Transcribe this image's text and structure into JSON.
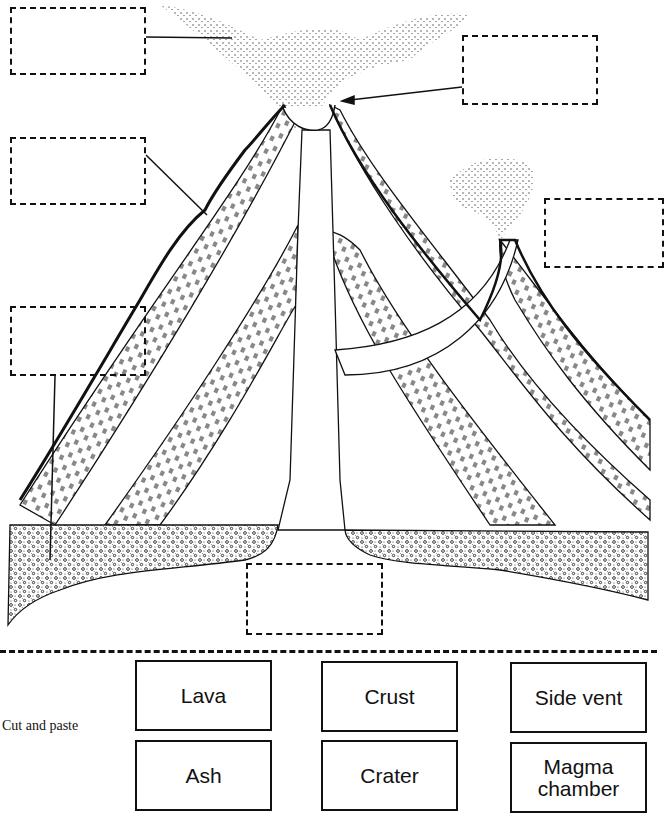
{
  "instructions": {
    "cut_label": "Cut and paste"
  },
  "answer_boxes": [
    {
      "id": "ash-cloud",
      "x": 10,
      "y": 7,
      "w": 136,
      "h": 68
    },
    {
      "id": "crater-top",
      "x": 462,
      "y": 35,
      "w": 136,
      "h": 70
    },
    {
      "id": "lava-slope",
      "x": 10,
      "y": 137,
      "w": 136,
      "h": 68
    },
    {
      "id": "side-vent",
      "x": 544,
      "y": 198,
      "w": 113,
      "h": 70
    },
    {
      "id": "crust",
      "x": 10,
      "y": 306,
      "w": 136,
      "h": 70
    },
    {
      "id": "magma-chamber",
      "x": 246,
      "y": 563,
      "w": 137,
      "h": 72
    }
  ],
  "cards": [
    {
      "label": "Lava",
      "x": 135,
      "y": 660,
      "w": 137,
      "h": 71
    },
    {
      "label": "Crust",
      "x": 321,
      "y": 661,
      "w": 137,
      "h": 71
    },
    {
      "label": "Side vent",
      "x": 510,
      "y": 662,
      "w": 137,
      "h": 71
    },
    {
      "label": "Ash",
      "x": 135,
      "y": 740,
      "w": 137,
      "h": 71
    },
    {
      "label": "Crater",
      "x": 321,
      "y": 740,
      "w": 137,
      "h": 71
    },
    {
      "label": "Magma\nchamber",
      "x": 510,
      "y": 742,
      "w": 137,
      "h": 71
    }
  ],
  "colors": {
    "ink": "#111111",
    "paper": "#ffffff"
  }
}
